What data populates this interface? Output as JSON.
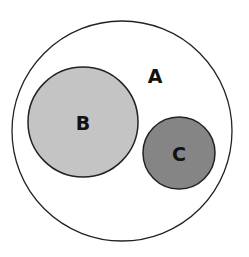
{
  "diagram": {
    "type": "nested-set-diagram",
    "sets": [
      {
        "id": "A",
        "label": "A",
        "fill": "#ffffff",
        "stroke": "#222222",
        "contains": [
          "B",
          "C"
        ]
      },
      {
        "id": "B",
        "label": "B",
        "fill": "#c4c4c4",
        "stroke": "#222222",
        "parent": "A"
      },
      {
        "id": "C",
        "label": "C",
        "fill": "#858585",
        "stroke": "#222222",
        "parent": "A"
      }
    ],
    "relationships": [
      "B is a subset of A",
      "C is a subset of A",
      "B and C are disjoint"
    ]
  }
}
